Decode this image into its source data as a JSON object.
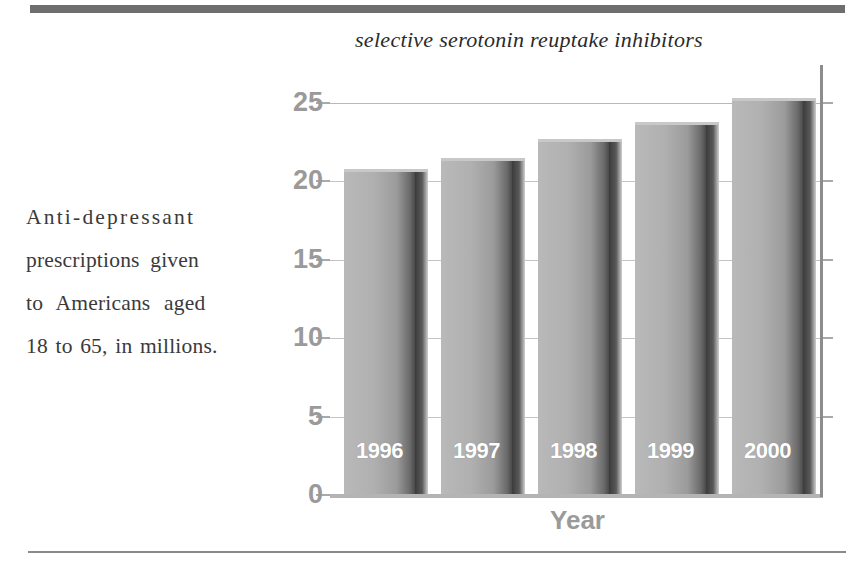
{
  "chart_data": {
    "type": "bar",
    "title": "selective serotonin reuptake inhibitors",
    "caption": "Anti-depressant prescriptions given to Americans aged 18 to 65, in millions.",
    "caption_lines": [
      "Anti-depressant",
      "prescriptions given",
      "to Americans aged",
      "18 to 65, in millions."
    ],
    "categories": [
      "1996",
      "1997",
      "1998",
      "1999",
      "2000"
    ],
    "values": [
      20.8,
      21.5,
      22.7,
      23.8,
      25.3
    ],
    "bar_labels": [
      "1996",
      "1997",
      "1998",
      "1999",
      "2000"
    ],
    "xlabel": "Year",
    "ylabel": "",
    "ylim": [
      0,
      25
    ],
    "yticks": [
      25,
      20,
      15,
      10,
      5,
      0
    ],
    "ytick_labels": [
      "25",
      "20",
      "15",
      "10",
      "5",
      "0"
    ],
    "grid": true,
    "legend": false,
    "colors": {
      "bar_front_light": "#b9b9b9",
      "bar_front_dark": "#4a4a4a",
      "bar_side": "#3b3b3b",
      "axis": "#8c8c8c",
      "gridline": "#b9b9b9",
      "tick_label": "#9a9a9a",
      "title_text": "#2a2a2a",
      "caption_text": "#3a3a3a",
      "bar_label_text": "#ffffff",
      "rule": "#6e6e6e",
      "background": "#ffffff"
    }
  }
}
